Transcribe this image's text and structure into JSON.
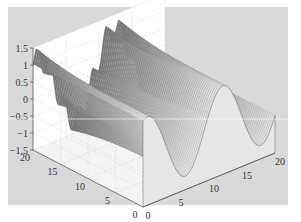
{
  "figure": {
    "background": "#ffffff",
    "axes_background": "#d9d9d9",
    "pane_color": "#ffffff",
    "grid_color": "#bdbdbd",
    "text_color": "#333333"
  },
  "chart_data": {
    "type": "surface",
    "title": "",
    "xlabel": "",
    "ylabel": "",
    "zlabel": "",
    "colormap": "gray",
    "x_ticks": [
      "0",
      "5",
      "10",
      "15",
      "20"
    ],
    "y_ticks": [
      "0",
      "5",
      "10",
      "15",
      "20"
    ],
    "z_ticks": [
      "-1.5",
      "-1",
      "-0.5",
      "0",
      "0.5",
      "1",
      "1.5"
    ],
    "xlim": [
      0,
      20
    ],
    "ylim": [
      0,
      20
    ],
    "zlim": [
      -1.5,
      1.5
    ],
    "grid": true,
    "legend": null,
    "surface_function": "z = sin(x*0.55 + 1.2) * 0.85 + 0.35*(y/20)^3*sin(3*x)",
    "peak_z": 1.5,
    "trough_z": -1.5
  },
  "labels": {
    "z": [
      "1.5",
      "1",
      "0.5",
      "0",
      "-0.5",
      "-1",
      "-1.5"
    ],
    "y_left": [
      "20",
      "15",
      "10",
      "5",
      "0"
    ],
    "x_right": [
      "0",
      "5",
      "10",
      "15",
      "20"
    ]
  }
}
